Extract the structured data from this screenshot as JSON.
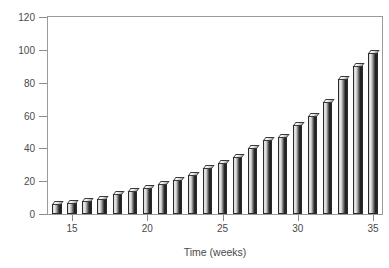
{
  "chart_data": {
    "type": "bar",
    "title": "",
    "subtitle": "",
    "xlabel": "Time (weeks)",
    "ylabel": "Lung volume (ml)",
    "xlim": [
      13.4,
      35.6
    ],
    "ylim": [
      0,
      120
    ],
    "grid": false,
    "legend": null,
    "xticks": [
      15,
      20,
      25,
      30,
      35
    ],
    "yticks": [
      0,
      20,
      40,
      60,
      80,
      100,
      120
    ],
    "xtick_labels": [
      "15",
      "20",
      "25",
      "30",
      "35"
    ],
    "ytick_labels": [
      "0",
      "20",
      "40",
      "60",
      "80",
      "100",
      "120"
    ],
    "categories": [
      14,
      15,
      16,
      17,
      18,
      19,
      20,
      21,
      22,
      23,
      24,
      25,
      26,
      27,
      28,
      29,
      30,
      31,
      32,
      33,
      34,
      35
    ],
    "values": [
      6,
      7,
      8,
      9,
      12,
      14,
      16,
      18,
      21,
      24,
      28,
      31,
      35,
      40,
      45,
      47,
      54,
      60,
      68,
      82,
      90,
      98
    ],
    "series": [
      {
        "name": "Lung volume",
        "values": [
          6,
          7,
          8,
          9,
          12,
          14,
          16,
          18,
          21,
          24,
          28,
          31,
          35,
          40,
          45,
          47,
          54,
          60,
          68,
          82,
          90,
          98
        ]
      }
    ],
    "bar_style": "3d-shaded-grayscale"
  },
  "axes": {
    "y_title": "Lung volume (ml)",
    "x_title": "Time (weeks)"
  }
}
